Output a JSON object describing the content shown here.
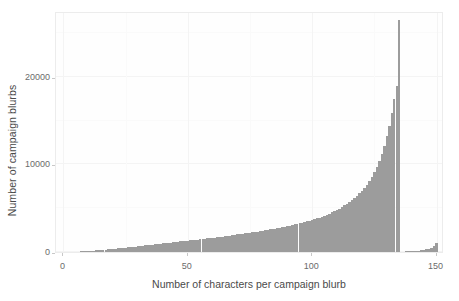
{
  "chart_data": {
    "type": "bar",
    "title": "",
    "subtitle": "",
    "xlabel": "Number of characters per campaign blurb",
    "ylabel": "Number of campaign blurbs",
    "xlim": [
      -3,
      153
    ],
    "ylim": [
      0,
      27500
    ],
    "xticks": [
      0,
      50,
      100,
      150
    ],
    "xtick_labels": [
      "0",
      "50",
      "100",
      "150"
    ],
    "yticks": [
      0,
      10000,
      20000
    ],
    "ytick_labels": [
      "0",
      "10000",
      "20000"
    ],
    "grid": true,
    "legend": "none",
    "bar_color": "#9c9c9c",
    "panel_background": "#fefefe",
    "binwidth": 1,
    "x": [
      0,
      1,
      2,
      3,
      4,
      5,
      6,
      7,
      8,
      9,
      10,
      11,
      12,
      13,
      14,
      15,
      16,
      17,
      18,
      19,
      20,
      21,
      22,
      23,
      24,
      25,
      26,
      27,
      28,
      29,
      30,
      31,
      32,
      33,
      34,
      35,
      36,
      37,
      38,
      39,
      40,
      41,
      42,
      43,
      44,
      45,
      46,
      47,
      48,
      49,
      50,
      51,
      52,
      53,
      54,
      55,
      56,
      57,
      58,
      59,
      60,
      61,
      62,
      63,
      64,
      65,
      66,
      67,
      68,
      69,
      70,
      71,
      72,
      73,
      74,
      75,
      76,
      77,
      78,
      79,
      80,
      81,
      82,
      83,
      84,
      85,
      86,
      87,
      88,
      89,
      90,
      91,
      92,
      93,
      94,
      95,
      96,
      97,
      98,
      99,
      100,
      101,
      102,
      103,
      104,
      105,
      106,
      107,
      108,
      109,
      110,
      111,
      112,
      113,
      114,
      115,
      116,
      117,
      118,
      119,
      120,
      121,
      122,
      123,
      124,
      125,
      126,
      127,
      128,
      129,
      130,
      131,
      132,
      133,
      134,
      135,
      136,
      137,
      138,
      139,
      140,
      141,
      142,
      143,
      144,
      145,
      146,
      147,
      148,
      149,
      150
    ],
    "values": [
      10,
      15,
      20,
      25,
      30,
      40,
      55,
      70,
      85,
      100,
      120,
      140,
      160,
      185,
      210,
      235,
      260,
      285,
      310,
      335,
      360,
      385,
      410,
      440,
      470,
      500,
      530,
      560,
      590,
      620,
      650,
      680,
      710,
      745,
      780,
      815,
      850,
      885,
      920,
      955,
      990,
      1020,
      1050,
      1080,
      1110,
      1140,
      1170,
      1200,
      1230,
      1260,
      1290,
      1320,
      1350,
      1380,
      1410,
      1445,
      1480,
      1515,
      1550,
      1585,
      1620,
      1655,
      1690,
      1725,
      1760,
      1800,
      1840,
      1880,
      1920,
      1960,
      2000,
      2040,
      2080,
      2120,
      2160,
      2200,
      2245,
      2290,
      2335,
      2380,
      2425,
      2470,
      2520,
      2570,
      2620,
      2670,
      2720,
      2780,
      2840,
      2900,
      2960,
      3020,
      3080,
      3150,
      3220,
      3290,
      3360,
      3430,
      3510,
      3590,
      3670,
      3750,
      3830,
      3930,
      4030,
      4140,
      4260,
      4380,
      4510,
      4650,
      4800,
      4960,
      5130,
      5310,
      5500,
      5710,
      5930,
      6170,
      6420,
      6690,
      6990,
      7320,
      7680,
      8090,
      8560,
      9100,
      9720,
      10420,
      11220,
      12140,
      13200,
      14420,
      15840,
      17500,
      19000,
      26500,
      30,
      45,
      60,
      75,
      95,
      115,
      140,
      170,
      210,
      260,
      320,
      400,
      500,
      650,
      1000
    ],
    "annotations": [
      {
        "text": "sharp spike at 135 characters",
        "x": 135,
        "y": 26500
      },
      {
        "text": "secondary small tail rising toward 150",
        "x": 150,
        "y": 1000
      }
    ]
  }
}
